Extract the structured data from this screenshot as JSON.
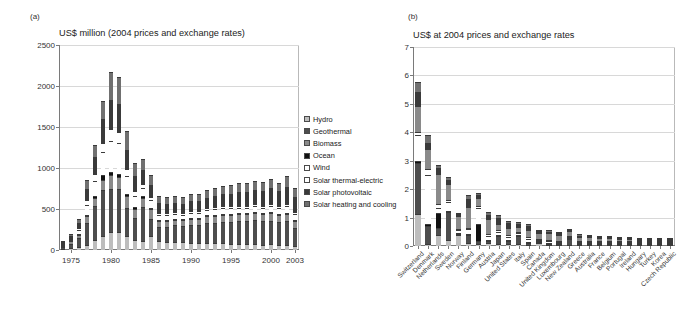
{
  "figure": {
    "panel_a_letter": "(a)",
    "panel_b_letter": "(b)"
  },
  "series_names": [
    "Hydro",
    "Geothermal",
    "Biomass",
    "Ocean",
    "Wind",
    "Solar thermal-electric",
    "Solar photovoltaic",
    "Solar heating and cooling"
  ],
  "series_colors": [
    "#bdbdbd",
    "#4d4d4d",
    "#8a8a8a",
    "#111111",
    "#ffffff",
    "#ffffff",
    "#3a3a3a",
    "#707070"
  ],
  "legend": {
    "items": [
      {
        "label": "Hydro",
        "color": "#bdbdbd"
      },
      {
        "label": "Geothermal",
        "color": "#4d4d4d"
      },
      {
        "label": "Biomass",
        "color": "#8a8a8a"
      },
      {
        "label": "Ocean",
        "color": "#111111"
      },
      {
        "label": "Wind",
        "color": "#ffffff"
      },
      {
        "label": "Solar thermal-electric",
        "color": "#ffffff"
      },
      {
        "label": "Solar photovoltaic",
        "color": "#3a3a3a"
      },
      {
        "label": "Solar heating and cooling",
        "color": "#707070"
      }
    ]
  },
  "chart_data": [
    {
      "type": "bar",
      "id": "panel-a",
      "title": "US$ million (2004 prices and exchange rates)",
      "xlabel": "",
      "ylabel": "",
      "ylim": [
        0,
        2500
      ],
      "yticks": [
        0,
        500,
        1000,
        1500,
        2000,
        2500
      ],
      "ytick_labels": [
        "0",
        "500",
        "1000",
        "1500",
        "2000",
        "2500"
      ],
      "grid": true,
      "stacked": true,
      "legend_position": "right",
      "categories": [
        "1974",
        "1975",
        "1976",
        "1977",
        "1978",
        "1979",
        "1980",
        "1981",
        "1982",
        "1983",
        "1984",
        "1985",
        "1986",
        "1987",
        "1988",
        "1989",
        "1990",
        "1991",
        "1992",
        "1993",
        "1994",
        "1995",
        "1996",
        "1997",
        "1998",
        "1999",
        "2000",
        "2001",
        "2002",
        "2003"
      ],
      "xtick_labels": [
        "1975",
        "1980",
        "1985",
        "1990",
        "1995",
        "2000",
        "2003"
      ],
      "xtick_indices": [
        1,
        6,
        11,
        16,
        21,
        26,
        29
      ],
      "series": [
        {
          "name": "Hydro",
          "values": [
            8,
            20,
            35,
            60,
            120,
            170,
            215,
            215,
            170,
            125,
            110,
            175,
            105,
            95,
            100,
            95,
            90,
            90,
            85,
            80,
            80,
            75,
            70,
            75,
            70,
            65,
            70,
            60,
            60,
            55
          ]
        },
        {
          "name": "Geothermal",
          "values": [
            20,
            55,
            110,
            275,
            420,
            560,
            535,
            530,
            345,
            260,
            410,
            200,
            180,
            190,
            200,
            200,
            215,
            215,
            245,
            255,
            265,
            265,
            280,
            280,
            300,
            285,
            290,
            280,
            290,
            215
          ]
        },
        {
          "name": "Biomass",
          "values": [
            5,
            30,
            40,
            75,
            90,
            130,
            165,
            150,
            140,
            120,
            120,
            120,
            75,
            70,
            70,
            70,
            75,
            75,
            80,
            80,
            85,
            85,
            85,
            80,
            85,
            85,
            90,
            85,
            95,
            85
          ]
        },
        {
          "name": "Ocean",
          "values": [
            2,
            5,
            8,
            15,
            35,
            50,
            40,
            35,
            30,
            25,
            20,
            20,
            12,
            10,
            10,
            10,
            10,
            10,
            10,
            10,
            10,
            10,
            10,
            10,
            10,
            10,
            10,
            10,
            10,
            10
          ]
        },
        {
          "name": "Wind",
          "values": [
            3,
            15,
            45,
            130,
            175,
            285,
            380,
            370,
            215,
            130,
            100,
            90,
            55,
            55,
            55,
            55,
            60,
            60,
            65,
            70,
            70,
            70,
            70,
            70,
            70,
            70,
            75,
            70,
            75,
            70
          ]
        },
        {
          "name": "Solar thermal-electric",
          "values": [
            2,
            10,
            30,
            60,
            85,
            110,
            145,
            140,
            90,
            60,
            50,
            45,
            28,
            25,
            25,
            25,
            25,
            25,
            25,
            25,
            25,
            25,
            25,
            25,
            25,
            25,
            25,
            25,
            25,
            25
          ]
        },
        {
          "name": "Solar photovoltaic",
          "values": [
            5,
            25,
            60,
            130,
            205,
            290,
            355,
            345,
            235,
            185,
            165,
            145,
            115,
            110,
            110,
            110,
            115,
            120,
            125,
            135,
            145,
            155,
            165,
            170,
            175,
            180,
            190,
            185,
            215,
            185
          ]
        },
        {
          "name": "Solar heating and cooling",
          "values": [
            5,
            30,
            52,
            105,
            155,
            225,
            335,
            325,
            225,
            155,
            130,
            115,
            85,
            85,
            85,
            85,
            90,
            90,
            95,
            95,
            100,
            105,
            105,
            100,
            105,
            105,
            110,
            105,
            125,
            105
          ]
        }
      ]
    },
    {
      "type": "bar",
      "id": "panel-b",
      "title": "US$ at 2004 prices and exchange rates",
      "xlabel": "",
      "ylabel": "",
      "ylim": [
        0,
        7
      ],
      "yticks": [
        0,
        1,
        2,
        3,
        4,
        5,
        6,
        7
      ],
      "ytick_labels": [
        "0",
        "1",
        "2",
        "3",
        "4",
        "5",
        "6",
        "7"
      ],
      "grid": true,
      "stacked": true,
      "categories": [
        "Switzerland",
        "Denmark",
        "Netherlands",
        "Sweden",
        "Norway",
        "Finland",
        "Germany",
        "Austria",
        "Japan",
        "United States",
        "Italy",
        "Spain",
        "Canada",
        "United Kingdom",
        "Luxembourg",
        "New Zealand",
        "Greece",
        "Australia",
        "France",
        "Belgium",
        "Portugal",
        "Ireland",
        "Hungary",
        "Turkey",
        "Korea",
        "Czech Republic"
      ],
      "series": [
        {
          "name": "Hydro",
          "values": [
            1.12,
            0.08,
            0.4,
            0.2,
            0.38,
            0.12,
            0.08,
            0.1,
            0.06,
            0.06,
            0.06,
            0.05,
            0.1,
            0.03,
            0.03,
            0.04,
            0.02,
            0.02,
            0.03,
            0.02,
            0.02,
            0.01,
            0.01,
            0.01,
            0.01,
            0.004
          ]
        },
        {
          "name": "Geothermal",
          "values": [
            1.8,
            0.62,
            0.22,
            1.0,
            0.06,
            0.28,
            0.1,
            0.06,
            0.3,
            0.1,
            0.3,
            0.04,
            0.04,
            0.02,
            0.02,
            0.22,
            0.02,
            0.02,
            0.02,
            0.01,
            0.01,
            0.01,
            0.01,
            0.005,
            0.005,
            0.003
          ]
        },
        {
          "name": "Ocean",
          "values": [
            0.06,
            0.08,
            0.55,
            0.02,
            0.02,
            0.04,
            0.58,
            0.06,
            0.04,
            0.02,
            0.02,
            0.02,
            0.03,
            0.02,
            0.02,
            0.01,
            0.02,
            0.01,
            0.01,
            0.01,
            0.01,
            0.01,
            0.005,
            0.004,
            0.004,
            0.002
          ]
        },
        {
          "name": "Wind",
          "values": [
            0.92,
            1.72,
            0.18,
            0.32,
            0.1,
            0.16,
            0.58,
            0.14,
            0.1,
            0.12,
            0.05,
            0.12,
            0.04,
            0.06,
            0.04,
            0.03,
            0.04,
            0.04,
            0.04,
            0.04,
            0.03,
            0.02,
            0.01,
            0.01,
            0.01,
            0.004
          ]
        },
        {
          "name": "Solar thermal-electric",
          "values": [
            0.1,
            0.22,
            0.12,
            0.06,
            0.04,
            0.04,
            0.08,
            0.08,
            0.06,
            0.06,
            0.04,
            0.06,
            0.03,
            0.04,
            0.03,
            0.02,
            0.03,
            0.03,
            0.02,
            0.02,
            0.02,
            0.01,
            0.01,
            0.01,
            0.005,
            0.002
          ]
        },
        {
          "name": "Biomass",
          "values": [
            0.92,
            0.68,
            1.08,
            0.56,
            0.44,
            0.74,
            0.26,
            0.52,
            0.22,
            0.26,
            0.2,
            0.26,
            0.22,
            0.24,
            0.22,
            0.16,
            0.14,
            0.12,
            0.1,
            0.1,
            0.08,
            0.06,
            0.05,
            0.03,
            0.02,
            0.012
          ]
        },
        {
          "name": "Solar photovoltaic",
          "values": [
            0.5,
            0.24,
            0.2,
            0.14,
            0.06,
            0.26,
            0.12,
            0.12,
            0.2,
            0.16,
            0.08,
            0.14,
            0.06,
            0.06,
            0.06,
            0.04,
            0.05,
            0.04,
            0.04,
            0.04,
            0.03,
            0.02,
            0.02,
            0.01,
            0.01,
            0.004
          ]
        },
        {
          "name": "Solar heating and cooling",
          "values": [
            0.36,
            0.26,
            0.1,
            0.1,
            0.05,
            0.16,
            0.08,
            0.12,
            0.12,
            0.1,
            0.07,
            0.08,
            0.05,
            0.05,
            0.04,
            0.03,
            0.04,
            0.03,
            0.03,
            0.02,
            0.02,
            0.02,
            0.01,
            0.01,
            0.01,
            0.003
          ]
        }
      ]
    }
  ]
}
